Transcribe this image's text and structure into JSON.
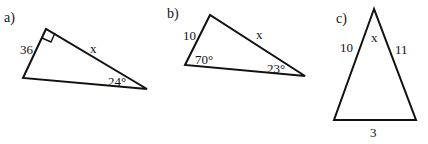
{
  "figures": [
    {
      "part_label": "a)",
      "type": "right-triangle",
      "vertices": {
        "right_angle": [
          46,
          29
        ],
        "bottom_left": [
          23,
          78
        ],
        "right": [
          147,
          89
        ]
      },
      "labels": {
        "side_left": "36",
        "hypotenuse_side": "x",
        "angle_right": "24°"
      }
    },
    {
      "part_label": "b)",
      "type": "triangle",
      "vertices": {
        "top": [
          210,
          15
        ],
        "left": [
          185,
          65
        ],
        "right": [
          305,
          76
        ]
      },
      "labels": {
        "side_left": "10",
        "side_top": "x",
        "angle_left": "70°",
        "angle_right": "23°"
      }
    },
    {
      "part_label": "c)",
      "type": "triangle",
      "vertices": {
        "apex": [
          374,
          9
        ],
        "bottom_left": [
          334,
          120
        ],
        "bottom_right": [
          416,
          120
        ]
      },
      "labels": {
        "side_left": "10",
        "side_right": "11",
        "angle_apex": "x",
        "side_bottom": "3"
      }
    }
  ]
}
